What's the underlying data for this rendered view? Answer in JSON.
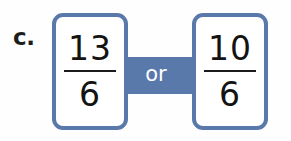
{
  "item": {
    "label": "c.",
    "type": "fraction-comparison"
  },
  "connector": {
    "label": "or",
    "color": "#5a79ab",
    "text_color": "#ffffff"
  },
  "cards": [
    {
      "name": "left",
      "numerator": "13",
      "denominator": "6",
      "border_color": "#5a79ab",
      "background": "#ffffff"
    },
    {
      "name": "right",
      "numerator": "10",
      "denominator": "6",
      "border_color": "#5a79ab",
      "background": "#ffffff"
    }
  ],
  "colors": {
    "accent": "#5a79ab",
    "text": "#131313",
    "page_background": "#fefefe"
  }
}
